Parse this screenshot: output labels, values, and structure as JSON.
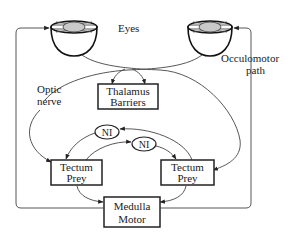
{
  "diagram": {
    "labels": {
      "eyes": "Eyes",
      "optic_nerve_line1": "Optic",
      "optic_nerve_line2": "nerve",
      "occulomotor_line1": "Occulomotor",
      "occulomotor_line2": "path"
    },
    "nodes": {
      "thalamus": {
        "line1": "Thalamus",
        "line2": "Barriers"
      },
      "tectum_left": {
        "line1": "Tectum",
        "line2": "Prey"
      },
      "tectum_right": {
        "line1": "Tectum",
        "line2": "Prey"
      },
      "medulla": {
        "line1": "Medulla",
        "line2": "Motor"
      },
      "ni_upper": {
        "label": "NI"
      },
      "ni_lower": {
        "label": "NI"
      }
    },
    "colors": {
      "stroke": "#222222",
      "lens_fill": "#c9c9c9",
      "background": "#ffffff"
    }
  }
}
